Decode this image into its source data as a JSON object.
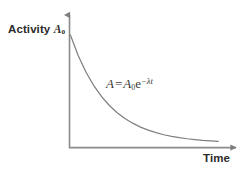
{
  "figure": {
    "background_color": "#ffffff",
    "line_color": "#808080",
    "text_color": "#2b2b2b",
    "annotation_color": "#3a3a3a"
  },
  "axes": {
    "y": {
      "label_text": "Activity",
      "label_symbol": "A",
      "label_subscript": "0",
      "arrow": "up-arrow"
    },
    "x": {
      "label_text": "Time",
      "arrow": "right-arrow"
    }
  },
  "annotation": {
    "full_text": "A = A0e−λt",
    "lhs": "A",
    "operator": "=",
    "amplitude": "A",
    "amplitude_subscript": "0",
    "base": "e",
    "exponent_sign": "−",
    "exponent_decay_constant": "λ",
    "exponent_variable": "t"
  },
  "chart_data": {
    "type": "line",
    "title": "",
    "xlabel": "Time",
    "ylabel": "Activity A₀",
    "grid": false,
    "legend": false,
    "xlim": [
      0,
      10
    ],
    "ylim": [
      0,
      1.12
    ],
    "x_tick_labels": [],
    "y_tick_labels": [],
    "annotations": [
      {
        "text": "A = A₀e⁻λᵗ",
        "x": 2.7,
        "y": 0.59
      }
    ],
    "series": [
      {
        "name": "Activity decay",
        "equation": "A = A0 * exp(-lambda * t)",
        "decay_constant": 0.42,
        "initial_value": 1.0,
        "color": "#808080",
        "x": [
          0.0,
          0.5,
          1.0,
          1.5,
          2.0,
          2.5,
          3.0,
          3.5,
          4.0,
          4.5,
          5.0,
          5.5,
          6.0,
          6.5,
          7.0,
          7.5,
          8.0,
          8.5,
          9.0,
          9.5
        ],
        "values": [
          1.0,
          0.811,
          0.657,
          0.533,
          0.432,
          0.35,
          0.284,
          0.23,
          0.187,
          0.151,
          0.122,
          0.099,
          0.08,
          0.065,
          0.053,
          0.043,
          0.035,
          0.028,
          0.023,
          0.018
        ]
      }
    ]
  }
}
